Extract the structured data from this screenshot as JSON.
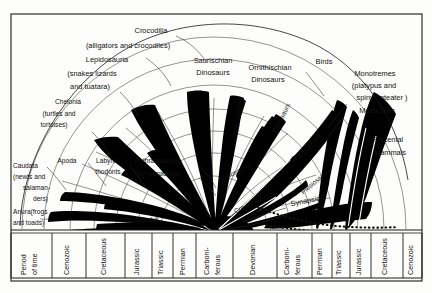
{
  "figure": {
    "title_absent": "",
    "frame": {
      "stroke": "#1a1a1a"
    },
    "colors": {
      "ink": "#111111",
      "paper": "#fdfdfb",
      "wedge_fill": "#000000"
    }
  },
  "taxa_labels": [
    {
      "id": "crocodilia",
      "text": "Crocodilia",
      "x": 151,
      "y": 33,
      "anchor": "middle",
      "size": "lbl"
    },
    {
      "id": "crocodilia-common",
      "text": "(alligators and crocodiles)",
      "x": 128,
      "y": 48,
      "anchor": "middle",
      "size": "lbl"
    },
    {
      "id": "lepidosauria",
      "text": "Lepidosauria",
      "x": 107,
      "y": 62,
      "anchor": "middle",
      "size": "lbl"
    },
    {
      "id": "lepidosauria-common-1",
      "text": "(snakes lizards",
      "x": 92,
      "y": 76,
      "anchor": "middle",
      "size": "lbl"
    },
    {
      "id": "lepidosauria-common-2",
      "text": "and tuatara)",
      "x": 90,
      "y": 89,
      "anchor": "middle",
      "size": "lbl"
    },
    {
      "id": "chelonia",
      "text": "Chelonia",
      "x": 68,
      "y": 104,
      "anchor": "middle",
      "size": "lbl-sm"
    },
    {
      "id": "chelonia-common-1",
      "text": "(turtles and",
      "x": 59,
      "y": 116,
      "anchor": "middle",
      "size": "lbl-sm"
    },
    {
      "id": "chelonia-common-2",
      "text": "tortoises)",
      "x": 54,
      "y": 127,
      "anchor": "middle",
      "size": "lbl-sm"
    },
    {
      "id": "saurischian-1",
      "text": "Saurischian",
      "x": 213,
      "y": 63,
      "anchor": "middle",
      "size": "lbl"
    },
    {
      "id": "saurischian-2",
      "text": "Dinosaurs",
      "x": 213,
      "y": 75,
      "anchor": "middle",
      "size": "lbl"
    },
    {
      "id": "ornithischian-1",
      "text": "Ornithischian",
      "x": 270,
      "y": 70,
      "anchor": "middle",
      "size": "lbl"
    },
    {
      "id": "ornithischian-2",
      "text": "Dinosaurs",
      "x": 268,
      "y": 82,
      "anchor": "middle",
      "size": "lbl"
    },
    {
      "id": "birds",
      "text": "Birds",
      "x": 324,
      "y": 64,
      "anchor": "middle",
      "size": "lbl"
    },
    {
      "id": "monotremes",
      "text": "Monotremes",
      "x": 375,
      "y": 76,
      "anchor": "middle",
      "size": "lbl"
    },
    {
      "id": "monotremes-common-1",
      "text": "(platypus and",
      "x": 374,
      "y": 88,
      "anchor": "middle",
      "size": "lbl"
    },
    {
      "id": "monotremes-common-2",
      "text": "spiny anteater )",
      "x": 382,
      "y": 100,
      "anchor": "middle",
      "size": "lbl"
    },
    {
      "id": "marsupials",
      "text": "Marsupials",
      "x": 377,
      "y": 113,
      "anchor": "middle",
      "size": "lbl"
    },
    {
      "id": "placental-1",
      "text": "Placental",
      "x": 388,
      "y": 142,
      "anchor": "middle",
      "size": "lbl"
    },
    {
      "id": "placental-2",
      "text": "Mammals",
      "x": 390,
      "y": 155,
      "anchor": "middle",
      "size": "lbl"
    },
    {
      "id": "caudata",
      "text": "Caudata",
      "x": 13,
      "y": 168,
      "anchor": "start",
      "size": "lbl-sm"
    },
    {
      "id": "caudata-common-1",
      "text": "(newts and",
      "x": 13,
      "y": 179,
      "anchor": "start",
      "size": "lbl-sm"
    },
    {
      "id": "caudata-common-2",
      "text": "salaman-",
      "x": 23,
      "y": 190,
      "anchor": "start",
      "size": "lbl-sm"
    },
    {
      "id": "caudata-common-3",
      "text": "ders)",
      "x": 33,
      "y": 201,
      "anchor": "start",
      "size": "lbl-sm"
    },
    {
      "id": "anura",
      "text": "Anura(frogs",
      "x": 13,
      "y": 214,
      "anchor": "start",
      "size": "lbl-sm"
    },
    {
      "id": "anura-common",
      "text": "and toads)",
      "x": 13,
      "y": 225,
      "anchor": "start",
      "size": "lbl-sm"
    },
    {
      "id": "apoda",
      "text": "Apoda",
      "x": 67,
      "y": 163,
      "anchor": "middle",
      "size": "lbl-sm"
    },
    {
      "id": "labyrinthodonts-1",
      "text": "Labyrin-",
      "x": 108,
      "y": 163,
      "anchor": "middle",
      "size": "lbl-sm"
    },
    {
      "id": "labyrinthodonts-2",
      "text": "thodonts",
      "x": 108,
      "y": 174,
      "anchor": "middle",
      "size": "lbl-sm"
    },
    {
      "id": "anthracosauria",
      "text": "Anthracosauria",
      "x": 157,
      "y": 163,
      "anchor": "middle",
      "size": "lbl-sm"
    },
    {
      "id": "temnospondyli",
      "text": "Temnospondyli",
      "x": 158,
      "y": 176,
      "anchor": "middle",
      "size": "lbl-sm"
    },
    {
      "id": "lepospondyli",
      "text": "Lepospondyli",
      "x": 139,
      "y": 222,
      "anchor": "middle",
      "size": "lbl-sm"
    },
    {
      "id": "cotylosauria",
      "text": "Cotylosauria",
      "x": 252,
      "y": 206,
      "anchor": "middle",
      "size": "lbl-sm",
      "rotate": -24
    },
    {
      "id": "synapsida",
      "text": "Synapsida",
      "x": 308,
      "y": 203,
      "anchor": "middle",
      "size": "lbl",
      "rotate": -11
    },
    {
      "id": "archosauria",
      "text": "Archosauria",
      "x": 235,
      "y": 175,
      "anchor": "middle",
      "size": "lbl-sm",
      "rotate": -27
    },
    {
      "id": "thecodontia",
      "text": "Thecodontia",
      "x": 240,
      "y": 117,
      "anchor": "middle",
      "size": "lbl-sm",
      "rotate": -86
    },
    {
      "id": "pterosaurs",
      "text": "Pterosaurs",
      "x": 283,
      "y": 119,
      "anchor": "middle",
      "size": "lbl-sm",
      "rotate": -62
    },
    {
      "id": "ichthyosauria",
      "text": "Ichthyosauria",
      "x": 307,
      "y": 150,
      "anchor": "middle",
      "size": "lbl-sm",
      "rotate": -44
    },
    {
      "id": "plesiosauria",
      "text": "Plesiosauria",
      "x": 317,
      "y": 183,
      "anchor": "middle",
      "size": "lbl-sm",
      "rotate": -40
    }
  ],
  "time_axis": {
    "header_line_1": "Period",
    "header_line_2": "of  time",
    "columns": [
      {
        "id": "cenozoic-left",
        "label": "Cenozoic",
        "x0": 52,
        "x1": 86,
        "two_line": false
      },
      {
        "id": "cretaceous-left",
        "label": "Cretaceous",
        "x0": 86,
        "x1": 125,
        "two_line": false
      },
      {
        "id": "jurassic-left",
        "label": "Jurassic",
        "x0": 125,
        "x1": 152,
        "two_line": false
      },
      {
        "id": "triassic-left",
        "label": "Triassic",
        "x0": 152,
        "x1": 173,
        "two_line": false
      },
      {
        "id": "permian-left",
        "label": "Permian",
        "x0": 173,
        "x1": 196,
        "two_line": false
      },
      {
        "id": "carboniferous-left",
        "label": "Carboni-",
        "label2": "ferous",
        "x0": 196,
        "x1": 233,
        "two_line": true
      },
      {
        "id": "devonian",
        "label": "Devonian",
        "x0": 233,
        "x1": 277,
        "two_line": false
      },
      {
        "id": "carboniferous-right",
        "label": "Carboni-",
        "label2": "ferous",
        "x0": 277,
        "x1": 312,
        "two_line": true
      },
      {
        "id": "permian-right",
        "label": "Permian",
        "x0": 312,
        "x1": 332,
        "two_line": false
      },
      {
        "id": "triassic-right",
        "label": "Triassic",
        "x0": 332,
        "x1": 350,
        "two_line": false
      },
      {
        "id": "jurassic-right",
        "label": "Jurassic",
        "x0": 350,
        "x1": 371,
        "two_line": false
      },
      {
        "id": "cretaceous-right",
        "label": "Cretaceous",
        "x0": 371,
        "x1": 403,
        "two_line": false
      },
      {
        "id": "cenozoic-right",
        "label": "Cenozoic",
        "x0": 403,
        "x1": 440,
        "two_line": false
      }
    ]
  }
}
